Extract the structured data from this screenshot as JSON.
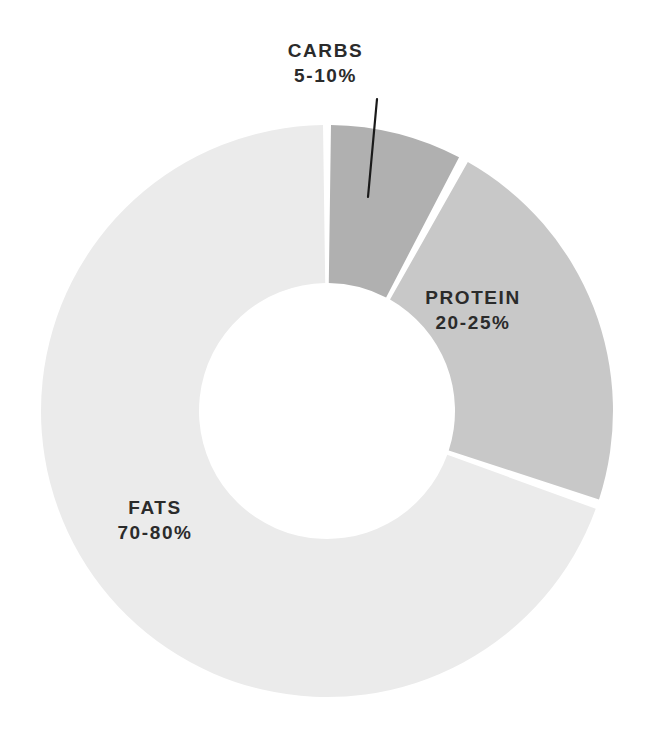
{
  "chart_data": {
    "type": "pie",
    "variant": "donut",
    "title": "",
    "subtitle": "",
    "xlabel": "",
    "ylabel": "",
    "grid": false,
    "legend_position": "none",
    "labels_inline": true,
    "background_color": "#ffffff",
    "label_color": "#2b2b2b",
    "leader_line_color": "#1a1a1a",
    "categories": [
      "CARBS",
      "PROTEIN",
      "FATS"
    ],
    "values": [
      7.5,
      22.5,
      75
    ],
    "value_labels": [
      "5-10%",
      "20-25%",
      "70-80%"
    ],
    "ranges": [
      {
        "min": 5,
        "max": 10
      },
      {
        "min": 20,
        "max": 25
      },
      {
        "min": 70,
        "max": 80
      }
    ],
    "colors": [
      "#b0b0b0",
      "#c8c8c8",
      "#ebebeb"
    ],
    "slices": [
      {
        "name": "CARBS",
        "value_label": "5-10%",
        "value": 7.5,
        "color": "#b0b0b0",
        "start_angle": 0.8,
        "end_angle": 27.5,
        "has_leader_line": true
      },
      {
        "name": "PROTEIN",
        "value_label": "20-25%",
        "value": 22.5,
        "color": "#c8c8c8",
        "start_angle": 29.5,
        "end_angle": 108.0,
        "has_leader_line": false
      },
      {
        "name": "FATS",
        "value_label": "70-80%",
        "value": 75,
        "color": "#ebebeb",
        "start_angle": 110.0,
        "end_angle": 359.2,
        "has_leader_line": false
      }
    ],
    "geometry": {
      "center_x": 327,
      "center_y": 411,
      "outer_radius": 286,
      "inner_radius": 128,
      "gap_degrees": 2
    }
  }
}
